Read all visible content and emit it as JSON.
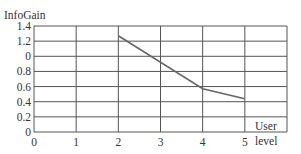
{
  "chart_data": {
    "type": "line",
    "title": "",
    "ylabel": "InfoGain",
    "xlabel": "User level",
    "xlabel_lines": [
      "User",
      "level"
    ],
    "x_ticks": [
      "0",
      "1",
      "2",
      "3",
      "4",
      "5"
    ],
    "y_ticks": [
      "0",
      "0.2",
      "0.4",
      "0.6",
      "0.8",
      "0",
      "1.2",
      "1.4"
    ],
    "y_tick_values": [
      0,
      0.2,
      0.4,
      0.6,
      0.8,
      1.0,
      1.2,
      1.4
    ],
    "xlim": [
      0,
      6
    ],
    "ylim": [
      0,
      1.4
    ],
    "grid": true,
    "legend": null,
    "series": [
      {
        "name": "InfoGain",
        "x": [
          2,
          4,
          5
        ],
        "values": [
          1.27,
          0.57,
          0.44
        ],
        "color": "#666666"
      }
    ]
  },
  "colors": {
    "grid": "#555555",
    "line": "#666666",
    "text": "#333333"
  }
}
